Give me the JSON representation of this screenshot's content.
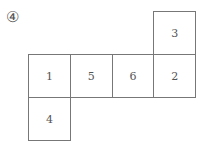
{
  "label": "④",
  "faces": [
    {
      "id": "3",
      "row": 0,
      "col": 3
    },
    {
      "id": "1",
      "row": 1,
      "col": 0
    },
    {
      "id": "5",
      "row": 1,
      "col": 1
    },
    {
      "id": "6",
      "row": 1,
      "col": 2
    },
    {
      "id": "2",
      "row": 1,
      "col": 3
    },
    {
      "id": "4",
      "row": 2,
      "col": 0
    }
  ]
}
